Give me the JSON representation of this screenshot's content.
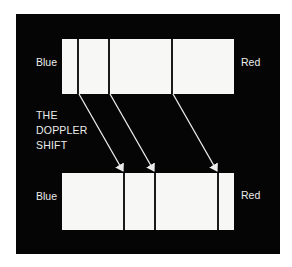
{
  "diagram": {
    "title_lines": [
      "THE",
      "DOPPLER",
      "SHIFT"
    ],
    "colors": {
      "background": "#050505",
      "spectrum_fill": "#f7f7f5",
      "line": "#1a1a1a",
      "arrow": "#ececec",
      "text": "#ececec"
    },
    "top_spectrum": {
      "left_label": "Blue",
      "right_label": "Red",
      "line_positions_px": [
        78,
        109,
        172
      ]
    },
    "bottom_spectrum": {
      "left_label": "Blue",
      "right_label": "Red",
      "line_positions_px": [
        124,
        155,
        218
      ]
    },
    "arrows": [
      {
        "from": [
          78,
          94
        ],
        "to": [
          124,
          173
        ]
      },
      {
        "from": [
          109,
          94
        ],
        "to": [
          155,
          173
        ]
      },
      {
        "from": [
          172,
          94
        ],
        "to": [
          218,
          173
        ]
      }
    ]
  }
}
